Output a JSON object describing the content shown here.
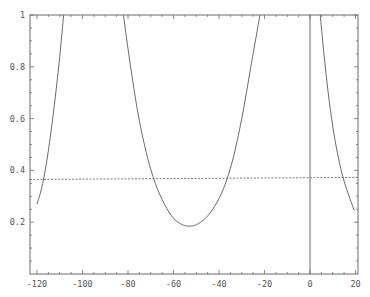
{
  "chart_data": {
    "type": "line",
    "title": "",
    "xlabel": "",
    "ylabel": "",
    "xlim": [
      -123,
      21
    ],
    "ylim": [
      0,
      1
    ],
    "grid": false,
    "legend": null,
    "x_ticks": [
      -120,
      -100,
      -80,
      -60,
      -40,
      -20,
      0,
      20
    ],
    "x_tick_labels": [
      "-120",
      "-100",
      "-80",
      "-60",
      "-40",
      "-20",
      "0",
      "20"
    ],
    "y_ticks": [
      0.2,
      0.4,
      0.6,
      0.8,
      1.0
    ],
    "y_tick_labels": [
      "0.2",
      "0.4",
      "0.6",
      "0.8",
      "1"
    ],
    "series": [
      {
        "name": "left-branch",
        "style": "solid",
        "x": [
          -120,
          -118,
          -116,
          -114,
          -112,
          -110,
          -108.3
        ],
        "y": [
          0.27,
          0.33,
          0.42,
          0.54,
          0.68,
          0.84,
          1.0
        ]
      },
      {
        "name": "middle-well",
        "style": "solid",
        "x": [
          -82,
          -80,
          -76,
          -72,
          -68,
          -64,
          -60,
          -56,
          -53,
          -50,
          -46,
          -42,
          -38,
          -34,
          -30,
          -26,
          -22
        ],
        "y": [
          1.0,
          0.87,
          0.64,
          0.47,
          0.35,
          0.27,
          0.215,
          0.19,
          0.185,
          0.19,
          0.215,
          0.26,
          0.33,
          0.44,
          0.6,
          0.8,
          1.0
        ]
      },
      {
        "name": "vertical-line-at-zero",
        "style": "solid",
        "x": [
          0,
          0
        ],
        "y": [
          0,
          1.0
        ]
      },
      {
        "name": "right-branch",
        "style": "solid",
        "x": [
          4.5,
          6,
          8,
          10,
          12,
          14,
          16,
          18,
          19.5
        ],
        "y": [
          1.0,
          0.86,
          0.7,
          0.57,
          0.47,
          0.39,
          0.33,
          0.28,
          0.245
        ]
      },
      {
        "name": "threshold",
        "style": "dashed",
        "x": [
          -123,
          21
        ],
        "y": [
          0.365,
          0.373
        ]
      }
    ]
  }
}
